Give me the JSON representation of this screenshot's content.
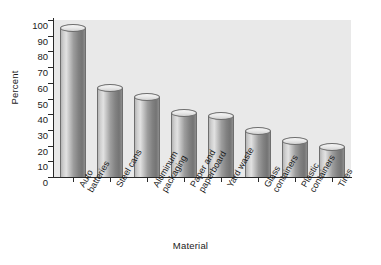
{
  "chart_data": {
    "type": "bar",
    "title": "",
    "xlabel": "Material",
    "ylabel": "Percent",
    "ylim": [
      0,
      100
    ],
    "ytick_step": 10,
    "yticks": [
      100,
      90,
      80,
      70,
      60,
      50,
      40,
      30,
      20,
      10,
      0
    ],
    "grid": false,
    "legend": null,
    "categories": [
      "Auto batteries",
      "Steel cans",
      "Aluminum packaging",
      "Paper and paperboard",
      "Yard waste",
      "Glass containers",
      "Plastic containers",
      "Tires"
    ],
    "category_lines": [
      [
        "Auto",
        "batteries"
      ],
      [
        "Steel cans",
        ""
      ],
      [
        "Aluminum",
        "packaging"
      ],
      [
        "Paper and",
        "paperboard"
      ],
      [
        "Yard waste",
        ""
      ],
      [
        "Glass",
        "containers"
      ],
      [
        "Plastic",
        "containers"
      ],
      [
        "Tires",
        ""
      ]
    ],
    "values": [
      95,
      57,
      51,
      41,
      39,
      29,
      23,
      19
    ],
    "bar_style": "3d-cylinder",
    "colors": {
      "plot_background": "#e9e9e9",
      "figure_background": "#ffffff",
      "axis": "#2a2a2a",
      "bar_light": "#e2e2e2",
      "bar_dark": "#747474",
      "bar_outline": "#6e6e6e",
      "text": "#1a1a1a"
    }
  }
}
